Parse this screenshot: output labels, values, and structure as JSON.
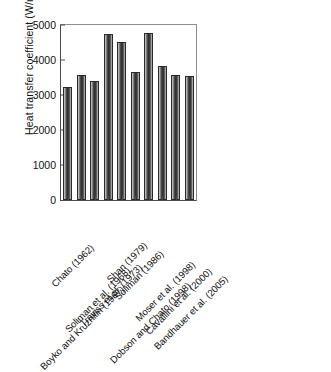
{
  "chart_data": {
    "type": "bar",
    "title": "",
    "xlabel": "",
    "ylabel": "Heat transfer coefficient (W/m2-K)",
    "ylabel_prefix": "Heat transfer coefficient (W/m",
    "ylabel_sup": "2",
    "ylabel_suffix": "-K)",
    "ylim": [
      0,
      5000
    ],
    "ytick_labels": [
      "0",
      "1000",
      "2000",
      "3000",
      "4000",
      "5000"
    ],
    "ytick_values": [
      0,
      1000,
      2000,
      3000,
      4000,
      5000
    ],
    "grid": false,
    "legend": false,
    "bar_color": "#3c3c3c",
    "bar_edge_color": "#2a2a2a",
    "categories": [
      "Chato (1962)",
      "Boyko and Kruzhilin (1967)",
      "Soliman et al. (1968)",
      "Traviss et al. (1973)",
      "Shan (1979)",
      "Soliman (1986)",
      "Dobson and Chato (1998)",
      "Moser et al. (1998)",
      "Cavallini et al. (2000)",
      "Bandhauer et al. (2005)"
    ],
    "values": [
      3230,
      3560,
      3410,
      4740,
      4520,
      3660,
      4760,
      3830,
      3580,
      3550
    ]
  }
}
